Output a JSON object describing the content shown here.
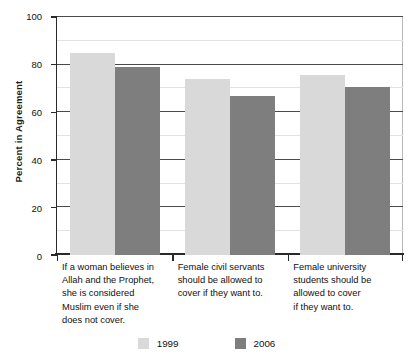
{
  "chart_data": {
    "type": "bar",
    "title": "",
    "xlabel": "",
    "ylabel": "Percent in Agreement",
    "ylim": [
      0,
      100
    ],
    "yticks": [
      0,
      20,
      40,
      60,
      80,
      100
    ],
    "ytick_labels": [
      "0",
      "20",
      "40",
      "60",
      "80",
      "100"
    ],
    "minor_gridlines": [
      10,
      30,
      50,
      70,
      90
    ],
    "grid": true,
    "legend_position": "bottom",
    "categories": [
      "If a woman believes in Allah and the Prophet, she is considered Muslim even if she does not cover.",
      "Female civil servants should be allowed to cover if they want to.",
      "Female university students should be allowed to cover if they want to."
    ],
    "category_lines": [
      [
        "If a woman believes in",
        "Allah and the Prophet,",
        "she is considered",
        "Muslim even if she",
        "does not cover."
      ],
      [
        "Female civil servants",
        "should be allowed to",
        "cover if they want to."
      ],
      [
        "Female university",
        "students should be",
        "allowed to cover",
        "if they want to."
      ]
    ],
    "series": [
      {
        "name": "1999",
        "color": "#d9d9d9",
        "values": [
          85,
          74,
          75.5
        ]
      },
      {
        "name": "2006",
        "color": "#7e7e7e",
        "values": [
          79,
          67,
          70.5
        ]
      }
    ]
  }
}
